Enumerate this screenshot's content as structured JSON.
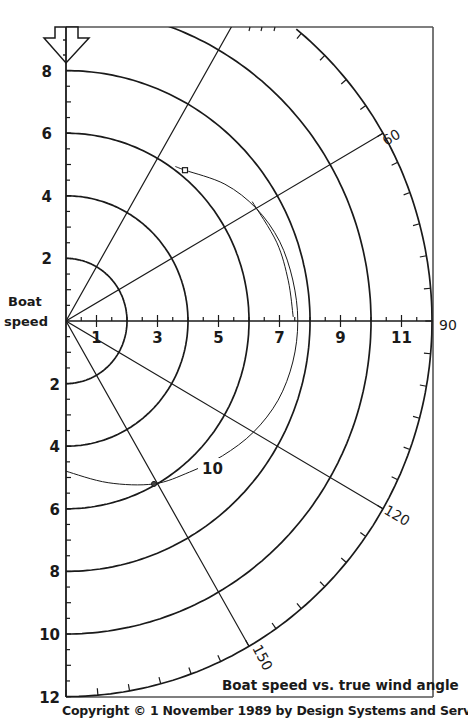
{
  "chart_data": {
    "type": "polar",
    "title": "Boat speed vs. true wind angle",
    "ylabel": "Boat speed",
    "angle_unit": "degrees (true wind angle, 0 = up)",
    "angle_range": [
      0,
      180
    ],
    "angle_labels": [
      {
        "angle": 60,
        "text": "60"
      },
      {
        "angle": 90,
        "text": "90"
      },
      {
        "angle": 120,
        "text": "120"
      },
      {
        "angle": 150,
        "text": "150"
      }
    ],
    "radial_lines": [
      30,
      60,
      120,
      150
    ],
    "speed_circles": [
      2,
      4,
      6,
      8,
      10
    ],
    "outer_radius": 12,
    "outer_tick_step_deg": 5,
    "radial_axis_range": [
      0,
      12
    ],
    "upper_axis_labels": [
      "2",
      "4",
      "6",
      "8"
    ],
    "lower_axis_labels": [
      "2",
      "4",
      "6",
      "8",
      "10",
      "12"
    ],
    "horizontal_axis_labels": [
      "1",
      "3",
      "5",
      "7",
      "9",
      "11"
    ],
    "series": [
      {
        "name": "10",
        "label": "10",
        "description": "polar curve for 10 knot true wind",
        "points": [
          {
            "angle": 36,
            "speed": 6.1
          },
          {
            "angle": 39,
            "speed": 6.2
          },
          {
            "angle": 50,
            "speed": 6.8
          },
          {
            "angle": 60,
            "speed": 7.2
          },
          {
            "angle": 70,
            "speed": 7.45
          },
          {
            "angle": 80,
            "speed": 7.55
          },
          {
            "angle": 90,
            "speed": 7.6
          },
          {
            "angle": 100,
            "speed": 7.55
          },
          {
            "angle": 110,
            "speed": 7.4
          },
          {
            "angle": 120,
            "speed": 7.1
          },
          {
            "angle": 130,
            "speed": 6.7
          },
          {
            "angle": 140,
            "speed": 6.3
          },
          {
            "angle": 151,
            "speed": 5.95
          },
          {
            "angle": 165,
            "speed": 5.35
          },
          {
            "angle": 180,
            "speed": 4.8
          }
        ],
        "markers": [
          {
            "angle": 39,
            "speed": 6.2,
            "shape": "square",
            "note": "optimum upwind VMG"
          },
          {
            "angle": 151,
            "speed": 5.95,
            "shape": "circle",
            "note": "optimum downwind VMG"
          }
        ]
      },
      {
        "name": "secondary",
        "description": "short alternate curve near beam reach",
        "points": [
          {
            "angle": 58,
            "speed": 7.2
          },
          {
            "angle": 70,
            "speed": 7.35
          },
          {
            "angle": 80,
            "speed": 7.4
          },
          {
            "angle": 89,
            "speed": 7.45
          }
        ]
      }
    ],
    "legend": null,
    "grid": true
  },
  "labels": {
    "ylabel_line1": "Boat",
    "ylabel_line2": "speed",
    "angle_60": "60",
    "angle_90": "90",
    "angle_120": "120",
    "angle_150": "150",
    "series_label": "10",
    "caption": "Boat speed vs. true wind angle",
    "copyright": "Copyright © 1 November 1989 by Design Systems and Services, Inc.",
    "upper_axis": [
      "2",
      "4",
      "6",
      "8"
    ],
    "lower_axis": [
      "2",
      "4",
      "6",
      "8",
      "10",
      "12"
    ],
    "horizontal_axis": [
      "1",
      "3",
      "5",
      "7",
      "9",
      "11"
    ]
  },
  "colors": {
    "ink": "#1a1a1a",
    "paper": "#ffffff"
  }
}
